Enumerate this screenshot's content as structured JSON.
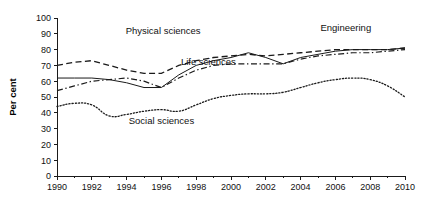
{
  "chart_data": {
    "type": "line",
    "title": "",
    "xlabel": "",
    "ylabel": "Per cent",
    "xlim": [
      1990,
      2010
    ],
    "ylim": [
      0,
      100
    ],
    "grid": false,
    "legend_position": "inline-annotations",
    "x": [
      1990,
      1991,
      1992,
      1993,
      1994,
      1995,
      1996,
      1997,
      1998,
      1999,
      2000,
      2001,
      2002,
      2003,
      2004,
      2005,
      2006,
      2007,
      2008,
      2009,
      2010
    ],
    "x_ticks": [
      1990,
      1992,
      1994,
      1996,
      1998,
      2000,
      2002,
      2004,
      2006,
      2008,
      2010
    ],
    "x_tick_labels": [
      "1990",
      "1992",
      "1994",
      "1996",
      "1998",
      "2000",
      "2002",
      "2004",
      "2006",
      "2008",
      "2010"
    ],
    "y_ticks": [
      0,
      10,
      20,
      30,
      40,
      50,
      60,
      70,
      80,
      90,
      100
    ],
    "y_tick_labels": [
      "0",
      "10",
      "20",
      "30",
      "40",
      "50",
      "60",
      "70",
      "80",
      "90",
      "100"
    ],
    "series": [
      {
        "name": "Physical sciences",
        "style": "dashed",
        "label_x": 1996.1,
        "label_y": 90,
        "values": [
          70,
          72,
          73,
          70,
          67,
          65,
          65,
          70,
          73,
          75,
          76,
          77,
          76,
          77,
          78,
          79,
          80,
          80,
          80,
          80,
          81
        ]
      },
      {
        "name": "Engineering",
        "style": "solid",
        "label_x": 2006.6,
        "label_y": 92,
        "values": [
          62,
          62,
          62,
          61,
          59,
          56,
          56,
          64,
          70,
          73,
          75,
          78,
          75,
          71,
          75,
          77,
          79,
          80,
          80,
          80,
          81
        ]
      },
      {
        "name": "Life sciences",
        "style": "dashdot",
        "label_x": 1998.7,
        "label_y": 70,
        "values": [
          54,
          57,
          60,
          61,
          62,
          60,
          56,
          62,
          67,
          70,
          71,
          71,
          71,
          71,
          74,
          76,
          77,
          78,
          78,
          79,
          80
        ]
      },
      {
        "name": "Social sciences",
        "style": "dotted",
        "label_x": 1996.0,
        "label_y": 33,
        "values": [
          44,
          46,
          45,
          38,
          39,
          41,
          42,
          41,
          45,
          49,
          51,
          52,
          52,
          53,
          56,
          59,
          61,
          62,
          61,
          57,
          50
        ]
      }
    ]
  },
  "layout": {
    "plot_left": 57,
    "plot_right": 405,
    "plot_top": 18,
    "plot_bottom": 176
  }
}
